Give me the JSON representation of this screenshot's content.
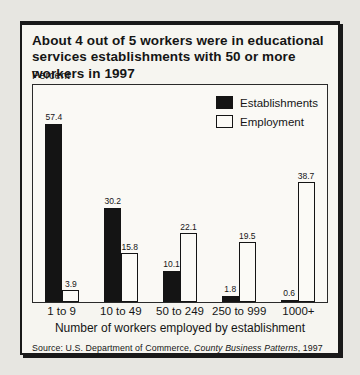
{
  "figure": {
    "source": {
      "prefix": "Source: U.S. Department of Commerce, ",
      "italic": "County Business Patterns",
      "suffix": ", 1997"
    }
  },
  "colors": {
    "establishments_bar": "#141414",
    "employment_bar": "#fbfaf6",
    "box_border": "#191919",
    "page_background": "#e7e6e1",
    "figure_background": "#f6f5f0"
  },
  "chart_data": {
    "type": "bar",
    "title": "About 4 out of 5 workers were in educational services establishments with 50 or more workers in 1997",
    "xlabel": "Number of workers employed by establishment",
    "ylabel": "Percent",
    "ylim": [
      0,
      70
    ],
    "grid": false,
    "legend_position": "top-right",
    "bar_value_labels": true,
    "categories": [
      "1 to 9",
      "10 to 49",
      "50 to 249",
      "250 to 999",
      "1000+"
    ],
    "series": [
      {
        "name": "Establishments",
        "key": "establishments",
        "color": "#141414",
        "values": [
          57.4,
          30.2,
          10.1,
          1.8,
          0.6
        ]
      },
      {
        "name": "Employment",
        "key": "employment",
        "color": "#fbfaf6",
        "values": [
          3.9,
          15.8,
          22.1,
          19.5,
          38.7
        ]
      }
    ]
  }
}
